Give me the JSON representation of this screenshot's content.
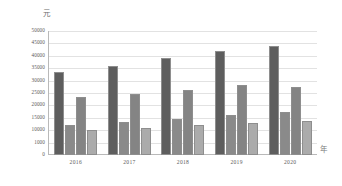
{
  "chart_data": {
    "type": "bar",
    "title": "",
    "subtitle": "",
    "xlabel": "年",
    "ylabel": "元",
    "categories": [
      "2016",
      "2017",
      "2018",
      "2019",
      "2020"
    ],
    "ylim": [
      0,
      50000
    ],
    "yticks": [
      "0",
      "1000",
      "10000",
      "15000",
      "20000",
      "25000",
      "30000",
      "35000",
      "40000",
      "45000",
      "50000"
    ],
    "ytick_values": [
      0,
      5000,
      10000,
      15000,
      20000,
      25000,
      30000,
      35000,
      40000,
      45000,
      50000
    ],
    "grid": true,
    "legend": "none",
    "series": [
      {
        "name": "series-1",
        "color": "#5e5e5e",
        "values": [
          33500,
          36000,
          39000,
          42000,
          43800
        ]
      },
      {
        "name": "series-2",
        "color": "#8a8a8a",
        "values": [
          12300,
          13300,
          14400,
          16000,
          17200
        ]
      },
      {
        "name": "series-3",
        "color": "#848484",
        "values": [
          23200,
          24700,
          26400,
          28300,
          27300
        ]
      },
      {
        "name": "series-4",
        "color": "#ababab",
        "values": [
          10200,
          11000,
          12000,
          13100,
          13600
        ]
      }
    ]
  },
  "axes": {
    "y_unit_label": "元",
    "x_unit_label": "年"
  }
}
